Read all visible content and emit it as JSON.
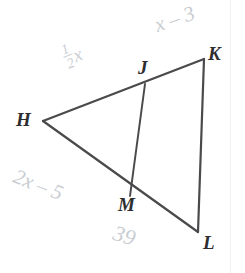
{
  "figure": {
    "kind": "geometry-diagram",
    "background_color": "#ffffff",
    "stroke_color": "#4a4a4c",
    "label_color": "#2e2e30",
    "annotation_color": "#c9cdd2",
    "vertices": [
      {
        "id": "H",
        "label": "H",
        "x": 43,
        "y": 121
      },
      {
        "id": "J",
        "label": "J",
        "x": 145,
        "y": 84
      },
      {
        "id": "K",
        "label": "K",
        "x": 204,
        "y": 59
      },
      {
        "id": "M",
        "label": "M",
        "x": 130,
        "y": 196
      },
      {
        "id": "L",
        "label": "L",
        "x": 198,
        "y": 232
      }
    ],
    "segments": [
      {
        "id": "HK",
        "from": "H",
        "to": "K"
      },
      {
        "id": "KL",
        "from": "K",
        "to": "L"
      },
      {
        "id": "LH",
        "from": "L",
        "to": "H"
      },
      {
        "id": "JM",
        "from": "J",
        "to": "M"
      }
    ],
    "annotations": [
      {
        "id": "HJ",
        "text": "x",
        "fraction": {
          "numerator": "1",
          "denominator": "2"
        },
        "full_text": "1/2 x",
        "on_segment": "HJ"
      },
      {
        "id": "JK",
        "text": "x – 3",
        "on_segment": "JK"
      },
      {
        "id": "HM",
        "text": "2x – 5",
        "on_segment": "HM"
      },
      {
        "id": "ML",
        "text": "39",
        "on_segment": "ML"
      }
    ]
  }
}
